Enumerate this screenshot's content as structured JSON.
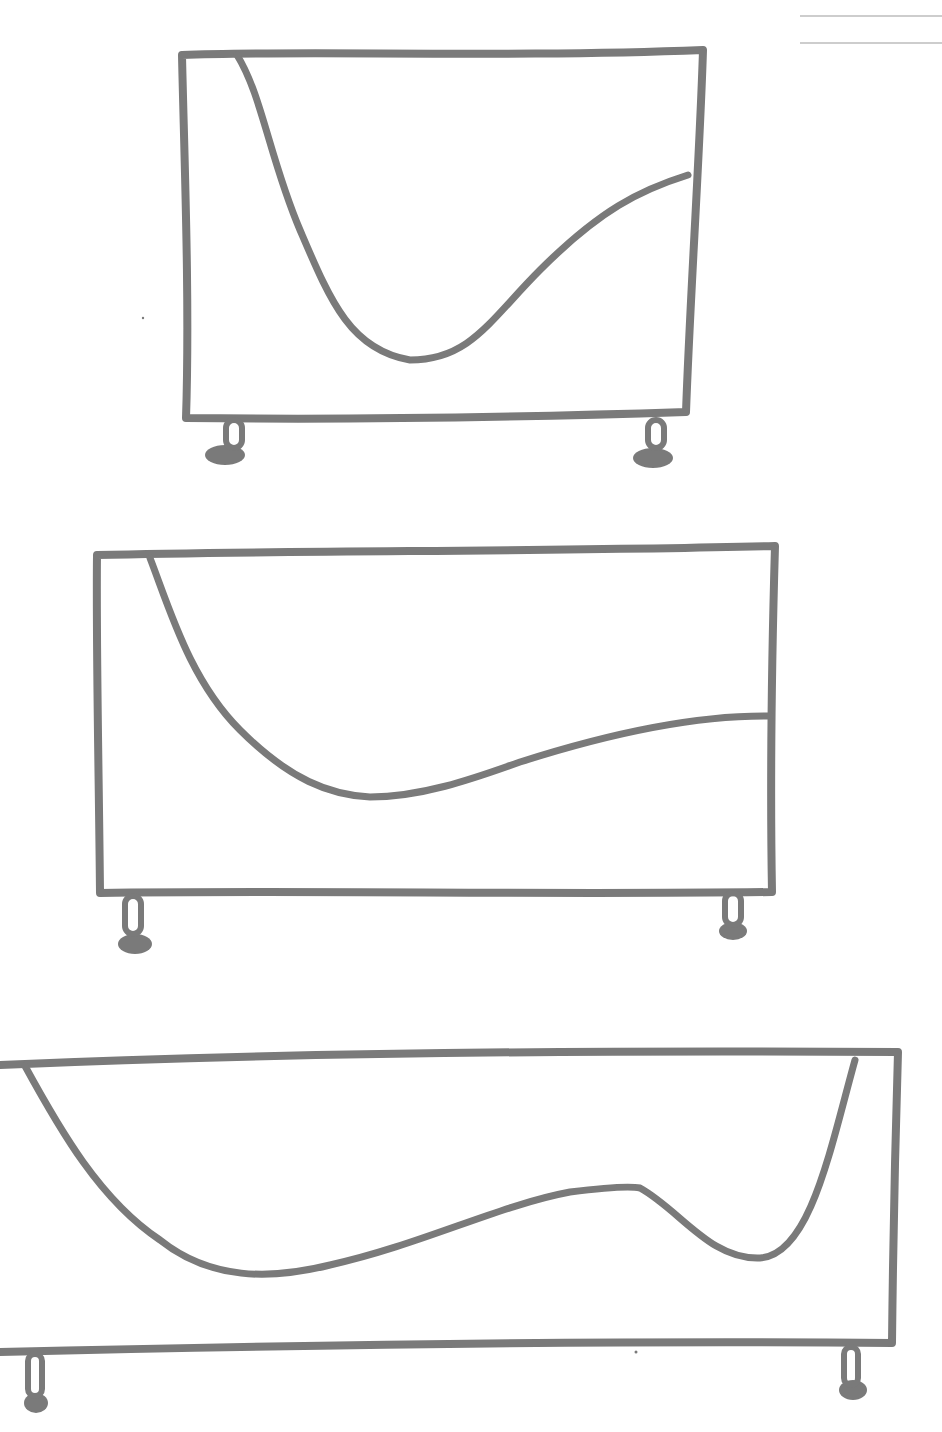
{
  "colors": {
    "background": "#ffffff",
    "line": "#7a7a7a",
    "rule": "#bdbdbd"
  },
  "stroke_width": 8,
  "rules": [
    {
      "x1": 800,
      "y1": 16,
      "x2": 942,
      "y2": 16
    },
    {
      "x1": 800,
      "y1": 43,
      "x2": 942,
      "y2": 43
    }
  ],
  "cabinets": [
    {
      "name": "cabinet-small",
      "outline": "M182,55 C300,50 500,58 703,50 C700,150 690,300 686,412 C500,418 350,420 186,418 C190,300 184,150 182,55 Z",
      "curve": "M237,55 C262,95 270,160 300,230 C330,300 350,350 410,360 C470,360 490,320 540,270 C600,210 640,190 688,175",
      "feet": [
        {
          "x": 226,
          "y": 420,
          "w": 16,
          "h": 28,
          "ex": 225,
          "ey": 455,
          "erx": 20,
          "ery": 10
        },
        {
          "x": 648,
          "y": 420,
          "w": 16,
          "h": 28,
          "ex": 653,
          "ey": 458,
          "erx": 20,
          "ery": 10
        }
      ]
    },
    {
      "name": "cabinet-medium",
      "outline": "M97,555 C300,550 550,552 775,546 C772,650 770,780 772,892 C550,895 300,890 100,893 C99,780 96,650 97,555 Z",
      "curve": "M150,558 C170,610 190,680 240,730 C290,780 330,795 370,797 C420,797 470,780 520,762 C620,730 700,715 770,716",
      "feet": [
        {
          "x": 125,
          "y": 896,
          "w": 16,
          "h": 38,
          "ex": 135,
          "ey": 944,
          "erx": 17,
          "ery": 10
        },
        {
          "x": 725,
          "y": 893,
          "w": 16,
          "h": 32,
          "ex": 733,
          "ey": 931,
          "erx": 14,
          "ery": 9
        }
      ]
    },
    {
      "name": "cabinet-large",
      "outline": "M0,1065 C300,1052 600,1050 898,1052 C895,1150 893,1250 892,1343 C600,1340 300,1345 0,1352",
      "curve": "M25,1066 C60,1130 100,1200 160,1240 C210,1280 270,1280 330,1265 C420,1245 500,1205 570,1192 C610,1187 630,1186 640,1188 C680,1210 710,1260 760,1258 C810,1255 830,1150 855,1060",
      "feet": [
        {
          "x": 28,
          "y": 1354,
          "w": 14,
          "h": 42,
          "ex": 36,
          "ey": 1403,
          "erx": 12,
          "ery": 10
        },
        {
          "x": 844,
          "y": 1347,
          "w": 14,
          "h": 38,
          "ex": 853,
          "ey": 1390,
          "erx": 14,
          "ery": 10
        }
      ]
    }
  ],
  "specks": [
    {
      "x": 143,
      "y": 318,
      "r": 1.2
    },
    {
      "x": 636,
      "y": 1352,
      "r": 1.5
    }
  ]
}
